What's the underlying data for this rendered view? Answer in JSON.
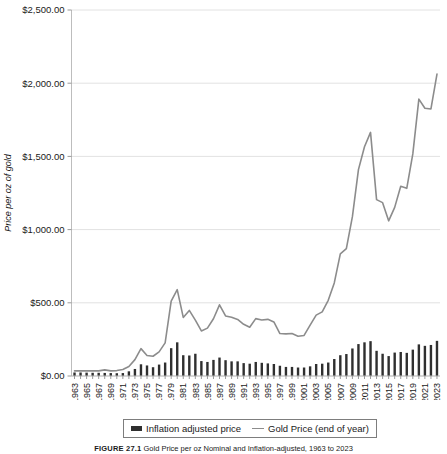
{
  "figure": {
    "caption_label": "FIGURE 27.1",
    "caption_text": "Gold Price per oz Nominal and Inflation-adjusted, 1963 to 2023"
  },
  "legend": {
    "position": "bottom",
    "entries": [
      {
        "label": "Inflation adjusted price",
        "marker": "bar-swatch",
        "color": "#2f2f2f"
      },
      {
        "label": "Gold Price (end of year)",
        "marker": "line-swatch",
        "color": "#8c8c8c"
      }
    ]
  },
  "chart_data": {
    "type": "bar",
    "title": "",
    "xlabel": "",
    "ylabel": "Price per oz of gold",
    "ylim": [
      0,
      2500
    ],
    "yticks": [
      0,
      500,
      1000,
      1500,
      2000,
      2500
    ],
    "ytick_labels": [
      "$0.00",
      "$500.00",
      "$1,000.00",
      "$1,500.00",
      "$2,000.00",
      "$2,500.00"
    ],
    "grid": true,
    "x": [
      1963,
      1964,
      1965,
      1966,
      1967,
      1968,
      1969,
      1970,
      1971,
      1972,
      1973,
      1974,
      1975,
      1976,
      1977,
      1978,
      1979,
      1980,
      1981,
      1982,
      1983,
      1984,
      1985,
      1986,
      1987,
      1988,
      1989,
      1990,
      1991,
      1992,
      1993,
      1994,
      1995,
      1996,
      1997,
      1998,
      1999,
      2000,
      2001,
      2002,
      2003,
      2004,
      2005,
      2006,
      2007,
      2008,
      2009,
      2010,
      2011,
      2012,
      2013,
      2014,
      2015,
      2016,
      2017,
      2018,
      2019,
      2020,
      2021,
      2022,
      2023
    ],
    "xtick_labels": [
      "1963",
      "1965",
      "1967",
      "1969",
      "1971",
      "1973",
      "1975",
      "1977",
      "1979",
      "1981",
      "1983",
      "1985",
      "1987",
      "1989",
      "1991",
      "1993",
      "1995",
      "1997",
      "1999",
      "2001",
      "2003",
      "2005",
      "2007",
      "2009",
      "2011",
      "2013",
      "2015",
      "2017",
      "2019",
      "2021",
      "2023"
    ],
    "series": [
      {
        "name": "Inflation adjusted price",
        "type": "bar",
        "color": "#2f2f2f",
        "values": [
          24,
          24,
          23,
          22,
          22,
          21,
          20,
          19,
          20,
          32,
          48,
          80,
          72,
          60,
          78,
          92,
          190,
          230,
          142,
          140,
          152,
          102,
          96,
          110,
          126,
          108,
          100,
          100,
          88,
          84,
          96,
          90,
          86,
          82,
          70,
          62,
          62,
          58,
          58,
          66,
          82,
          84,
          92,
          116,
          142,
          150,
          188,
          218,
          230,
          238,
          172,
          152,
          136,
          160,
          164,
          158,
          180,
          216,
          206,
          212,
          240
        ]
      },
      {
        "name": "Gold Price (end of year)",
        "type": "line",
        "color": "#8c8c8c",
        "values": [
          35,
          35,
          35,
          35,
          35,
          42,
          35,
          37,
          44,
          65,
          112,
          187,
          140,
          135,
          165,
          226,
          512,
          590,
          400,
          448,
          382,
          308,
          327,
          391,
          486,
          410,
          401,
          386,
          353,
          333,
          392,
          383,
          387,
          369,
          290,
          288,
          290,
          272,
          277,
          348,
          416,
          438,
          517,
          636,
          834,
          870,
          1088,
          1410,
          1566,
          1664,
          1205,
          1184,
          1060,
          1152,
          1296,
          1282,
          1517,
          1891,
          1829,
          1824,
          2062
        ]
      }
    ]
  }
}
